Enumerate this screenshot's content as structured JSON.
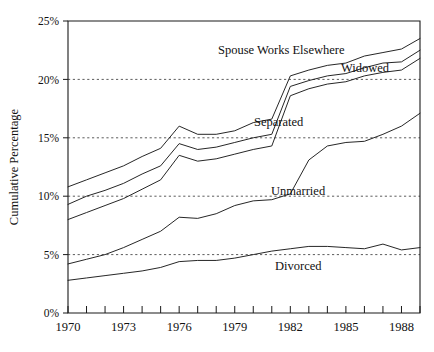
{
  "chart_data": {
    "type": "line",
    "title": "",
    "xlabel": "",
    "ylabel": "Cumulative Percentage",
    "xlim": [
      1970,
      1989
    ],
    "ylim": [
      0,
      25
    ],
    "grid": true,
    "grid_axis": "y",
    "legend_position": "inline-annotations",
    "x": [
      1970,
      1971,
      1972,
      1973,
      1974,
      1975,
      1976,
      1977,
      1978,
      1979,
      1980,
      1981,
      1982,
      1983,
      1984,
      1985,
      1986,
      1987,
      1988,
      1989
    ],
    "y_ticks": [
      0,
      5,
      10,
      15,
      20,
      25
    ],
    "y_tick_labels": [
      "0%",
      "5%",
      "10%",
      "15%",
      "20%",
      "25%"
    ],
    "x_ticks": [
      1970,
      1971,
      1972,
      1973,
      1974,
      1975,
      1976,
      1977,
      1978,
      1979,
      1980,
      1981,
      1982,
      1983,
      1984,
      1985,
      1986,
      1987,
      1988,
      1989
    ],
    "x_tick_labels_shown": [
      "1970",
      "1973",
      "1976",
      "1979",
      "1982",
      "1985",
      "1988"
    ],
    "x_tick_labels_years": [
      1970,
      1973,
      1976,
      1979,
      1982,
      1985,
      1988
    ],
    "series": [
      {
        "name": "Spouse Works Elsewhere",
        "label": "Spouse Works Elsewhere",
        "values": [
          10.8,
          11.4,
          12.0,
          12.6,
          13.4,
          14.1,
          16.0,
          15.3,
          15.3,
          15.6,
          16.3,
          16.6,
          20.3,
          20.8,
          21.2,
          21.4,
          22.0,
          22.3,
          22.6,
          23.5
        ]
      },
      {
        "name": "Widowed",
        "label": "Widowed",
        "values": [
          9.3,
          10.0,
          10.5,
          11.1,
          11.9,
          12.6,
          14.5,
          14.0,
          14.2,
          14.6,
          15.0,
          15.3,
          19.4,
          19.9,
          20.3,
          20.5,
          21.0,
          21.4,
          21.5,
          22.5
        ]
      },
      {
        "name": "Separated",
        "label": "Separated",
        "values": [
          8.0,
          8.6,
          9.2,
          9.8,
          10.6,
          11.4,
          13.5,
          13.0,
          13.2,
          13.6,
          14.0,
          14.3,
          18.6,
          19.2,
          19.6,
          19.8,
          20.3,
          20.6,
          20.8,
          21.8
        ]
      },
      {
        "name": "Unmarried",
        "label": "Unmarried",
        "values": [
          4.2,
          4.6,
          5.0,
          5.6,
          6.3,
          7.0,
          8.2,
          8.1,
          8.5,
          9.2,
          9.6,
          9.7,
          10.2,
          13.1,
          14.3,
          14.6,
          14.7,
          15.3,
          16.0,
          17.1
        ]
      },
      {
        "name": "Divorced",
        "label": "Divorced",
        "values": [
          2.8,
          3.0,
          3.2,
          3.4,
          3.6,
          3.9,
          4.4,
          4.5,
          4.5,
          4.7,
          5.0,
          5.3,
          5.5,
          5.7,
          5.7,
          5.6,
          5.5,
          5.9,
          5.4,
          5.6
        ]
      }
    ],
    "annotations": [
      {
        "text": "Spouse Works Elsewhere",
        "x_px": 218,
        "y_px": 54
      },
      {
        "text": "Widowed",
        "x_px": 341,
        "y_px": 72
      },
      {
        "text": "Separated",
        "x_px": 254,
        "y_px": 126
      },
      {
        "text": "Unmarried",
        "x_px": 271,
        "y_px": 195
      },
      {
        "text": "Divorced",
        "x_px": 275,
        "y_px": 270
      }
    ],
    "colors": {
      "line": "#1a1a1a",
      "grid": "#4a4a4a",
      "axis": "#1a1a1a",
      "background": "#ffffff"
    }
  }
}
